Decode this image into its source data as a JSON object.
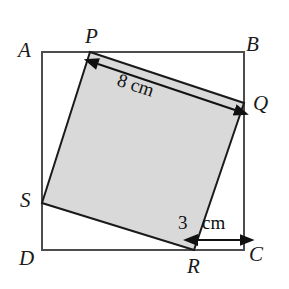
{
  "figure": {
    "type": "geometry-diagram",
    "width": 289,
    "height": 289,
    "background_color": "#ffffff",
    "outer_square": {
      "name": "ABCD",
      "stroke_color": "#4d4d4d",
      "stroke_width": 2,
      "fill": "none",
      "vertices": [
        {
          "label": "A",
          "x": 42,
          "y": 52
        },
        {
          "label": "B",
          "x": 244,
          "y": 52
        },
        {
          "label": "C",
          "x": 244,
          "y": 250
        },
        {
          "label": "D",
          "x": 42,
          "y": 250
        }
      ]
    },
    "inner_square": {
      "name": "PQRS",
      "stroke_color": "#1a1a1a",
      "stroke_width": 2,
      "fill_color": "#d9d9d9",
      "vertices": [
        {
          "label": "P",
          "x": 90,
          "y": 52
        },
        {
          "label": "Q",
          "x": 244,
          "y": 103
        },
        {
          "label": "R",
          "x": 194,
          "y": 250
        },
        {
          "label": "S",
          "x": 42,
          "y": 203
        }
      ]
    },
    "vertex_labels": [
      {
        "id": "A",
        "text": "A",
        "x": 18,
        "y": 40
      },
      {
        "id": "B",
        "text": "B",
        "x": 246,
        "y": 34
      },
      {
        "id": "P",
        "text": "P",
        "x": 85,
        "y": 26
      },
      {
        "id": "Q",
        "text": "Q",
        "x": 253,
        "y": 93
      },
      {
        "id": "S",
        "text": "S",
        "x": 20,
        "y": 190
      },
      {
        "id": "D",
        "text": "D",
        "x": 19,
        "y": 248
      },
      {
        "id": "R",
        "text": "R",
        "x": 187,
        "y": 256
      },
      {
        "id": "C",
        "text": "C",
        "x": 249,
        "y": 244
      }
    ],
    "dimensions": [
      {
        "id": "pq-dimension",
        "text": "8 cm",
        "value": 8,
        "unit": "cm",
        "measures": "PQ",
        "orientation": "rotated",
        "angle_deg": 18.3,
        "label_x": 121,
        "label_y": 70,
        "arrow": {
          "x1": 98,
          "y1": 64,
          "x2": 235,
          "y2": 110,
          "double_headed": true,
          "color": "#111111"
        }
      },
      {
        "id": "rc-dimension",
        "text": "3 cm",
        "value": 3,
        "unit": "cm",
        "measures": "RC",
        "orientation": "horizontal",
        "number_text": "3",
        "unit_text": "cm",
        "number_x": 178,
        "number_y": 213,
        "unit_x": 202,
        "unit_y": 213,
        "arrow": {
          "x1": 197,
          "y1": 240,
          "x2": 241,
          "y2": 240,
          "double_headed": true,
          "color": "#111111"
        }
      }
    ]
  }
}
